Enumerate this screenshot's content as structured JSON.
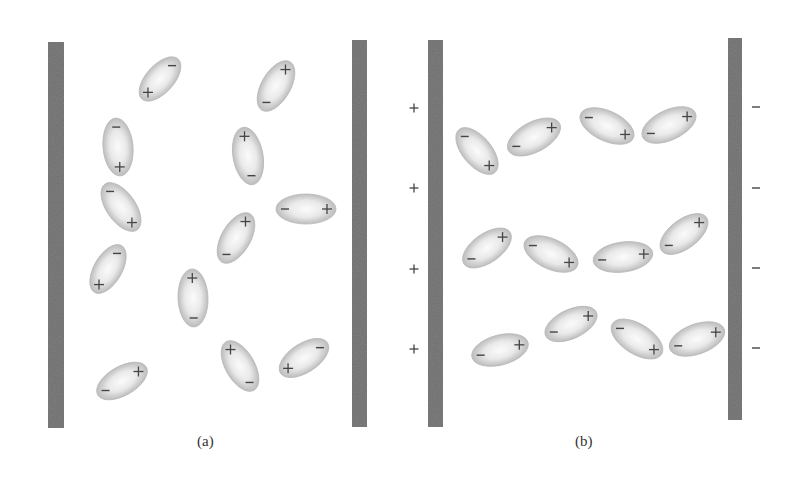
{
  "colors": {
    "plate": "#6f6f6f",
    "molecule_edge": "#b8b8b8",
    "molecule_center": "#fafafa",
    "charge": "#444444",
    "background": "#ffffff"
  },
  "captions": {
    "a": "(a)",
    "b": "(b)"
  },
  "charge_symbols": {
    "plus": "+",
    "minus": "−"
  },
  "panels": {
    "a": {
      "description": "Dielectric without external field: randomly oriented polar molecules between plates",
      "plates": [
        {
          "x": 48,
          "y": 42,
          "w": 16,
          "h": 386
        },
        {
          "x": 352,
          "y": 40,
          "w": 15,
          "h": 387
        }
      ],
      "external_charges": [],
      "molecules": [
        {
          "cx": 160,
          "cy": 79,
          "len": 54,
          "wid": 28,
          "angle": 132
        },
        {
          "cx": 118,
          "cy": 147,
          "len": 58,
          "wid": 30,
          "angle": 85
        },
        {
          "cx": 121,
          "cy": 207,
          "len": 56,
          "wid": 29,
          "angle": 55
        },
        {
          "cx": 108,
          "cy": 269,
          "len": 54,
          "wid": 28,
          "angle": 120
        },
        {
          "cx": 122,
          "cy": 381,
          "len": 56,
          "wid": 29,
          "angle": -30
        },
        {
          "cx": 276,
          "cy": 86,
          "len": 56,
          "wid": 29,
          "angle": -60
        },
        {
          "cx": 248,
          "cy": 156,
          "len": 58,
          "wid": 30,
          "angle": -100
        },
        {
          "cx": 306,
          "cy": 209,
          "len": 60,
          "wid": 30,
          "angle": 0
        },
        {
          "cx": 236,
          "cy": 238,
          "len": 56,
          "wid": 29,
          "angle": -60
        },
        {
          "cx": 193,
          "cy": 298,
          "len": 58,
          "wid": 30,
          "angle": -92
        },
        {
          "cx": 240,
          "cy": 366,
          "len": 56,
          "wid": 29,
          "angle": -120
        },
        {
          "cx": 304,
          "cy": 358,
          "len": 56,
          "wid": 29,
          "angle": 147
        }
      ]
    },
    "b": {
      "description": "Dielectric in external field: molecules aligned with field between charged plates",
      "plates": [
        {
          "x": 428,
          "y": 40,
          "w": 15,
          "h": 387
        },
        {
          "x": 728,
          "y": 38,
          "w": 14,
          "h": 382
        }
      ],
      "external_charges": [
        {
          "x": 414,
          "y": 108,
          "sign": "plus"
        },
        {
          "x": 414,
          "y": 188,
          "sign": "plus"
        },
        {
          "x": 414,
          "y": 269,
          "sign": "plus"
        },
        {
          "x": 414,
          "y": 349,
          "sign": "plus"
        },
        {
          "x": 756,
          "y": 107,
          "sign": "minus"
        },
        {
          "x": 756,
          "y": 188,
          "sign": "minus"
        },
        {
          "x": 756,
          "y": 268,
          "sign": "minus"
        },
        {
          "x": 756,
          "y": 348,
          "sign": "minus"
        }
      ],
      "molecules": [
        {
          "cx": 477,
          "cy": 151,
          "len": 56,
          "wid": 29,
          "angle": 50
        },
        {
          "cx": 534,
          "cy": 137,
          "len": 58,
          "wid": 30,
          "angle": -28
        },
        {
          "cx": 607,
          "cy": 126,
          "len": 58,
          "wid": 30,
          "angle": 25
        },
        {
          "cx": 669,
          "cy": 125,
          "len": 58,
          "wid": 30,
          "angle": -25
        },
        {
          "cx": 487,
          "cy": 248,
          "len": 56,
          "wid": 29,
          "angle": -35
        },
        {
          "cx": 551,
          "cy": 254,
          "len": 58,
          "wid": 30,
          "angle": 25
        },
        {
          "cx": 623,
          "cy": 257,
          "len": 60,
          "wid": 30,
          "angle": -8
        },
        {
          "cx": 684,
          "cy": 234,
          "len": 56,
          "wid": 29,
          "angle": -37
        },
        {
          "cx": 500,
          "cy": 350,
          "len": 58,
          "wid": 30,
          "angle": -15
        },
        {
          "cx": 571,
          "cy": 324,
          "len": 56,
          "wid": 29,
          "angle": -25
        },
        {
          "cx": 637,
          "cy": 339,
          "len": 58,
          "wid": 30,
          "angle": 32
        },
        {
          "cx": 697,
          "cy": 339,
          "len": 58,
          "wid": 30,
          "angle": -20
        }
      ]
    }
  }
}
